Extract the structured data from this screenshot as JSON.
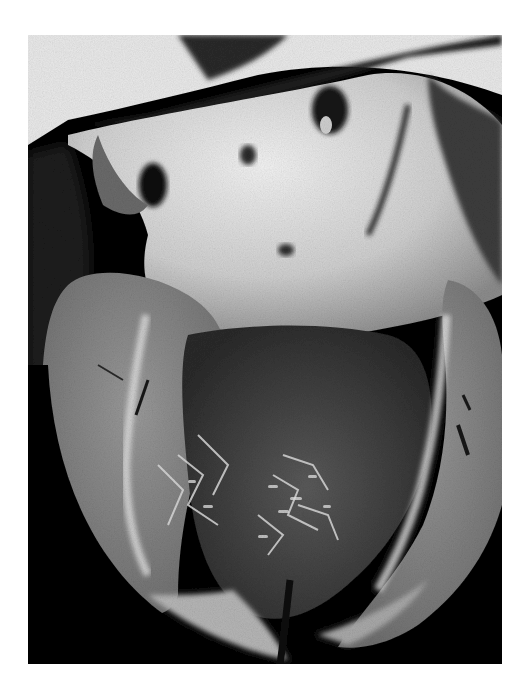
{
  "image": {
    "subject": "heart-specimen-photograph",
    "mode": "grayscale",
    "background_color": "#ffffff",
    "photo_background_color": "#050505",
    "tissue_colors": {
      "atrial_upper_light": "#e6e6e6",
      "myocardium_wall": "#8a8a8a",
      "ventricle_cavity_dark": "#3a3a3a",
      "trabeculae_highlight": "#d8d8d8"
    }
  }
}
